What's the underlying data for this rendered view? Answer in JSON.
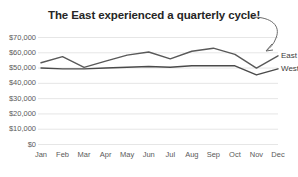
{
  "chart_data": {
    "type": "line",
    "title": "The East experienced a quarterly cycle!",
    "xlabel": "",
    "ylabel": "",
    "categories": [
      "Jan",
      "Feb",
      "Mar",
      "Apr",
      "May",
      "Jun",
      "Jul",
      "Aug",
      "Sep",
      "Oct",
      "Nov",
      "Dec"
    ],
    "series": [
      {
        "name": "East",
        "color": "#595959",
        "values": [
          53500,
          57500,
          50500,
          54500,
          58500,
          60500,
          56000,
          61000,
          63000,
          59000,
          50000,
          58000
        ]
      },
      {
        "name": "West",
        "color": "#4a4a4a",
        "values": [
          50000,
          49500,
          49500,
          50000,
          50500,
          51000,
          50500,
          51500,
          51500,
          51500,
          45500,
          49500
        ]
      }
    ],
    "ylim": [
      0,
      70000
    ],
    "yticks": [
      "$0",
      "$10,000",
      "$20,000",
      "$30,000",
      "$40,000",
      "$50,000",
      "$60,000",
      "$70,000"
    ],
    "ytick_values": [
      0,
      10000,
      20000,
      30000,
      40000,
      50000,
      60000,
      70000
    ],
    "grid": true,
    "grid_color": "#e6e6e6",
    "legend_position": "right-inline",
    "background": "#ffffff",
    "annotation": {
      "name": "curved-arrow",
      "text": "",
      "points_to": "East series Nov peak"
    }
  }
}
